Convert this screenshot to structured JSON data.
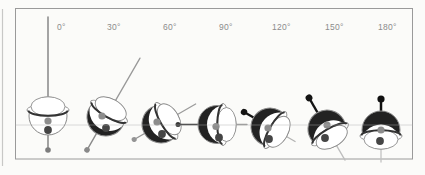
{
  "diagram": {
    "figures": [
      {
        "label": "0°",
        "angle": 0,
        "antenna_color": "#8f8f8f",
        "ball_rod_color": "#7d7d7d"
      },
      {
        "label": "30°",
        "angle": 30,
        "antenna_color": "#999999",
        "ball_rod_color": "#8a8a8a"
      },
      {
        "label": "60°",
        "angle": 60,
        "antenna_color": "#9b9b9b",
        "ball_rod_color": "#949494"
      },
      {
        "label": "90°",
        "angle": 90,
        "antenna_color": "#9b9b9b",
        "ball_rod_color": "#3a3a3a"
      },
      {
        "label": "120°",
        "angle": 120,
        "antenna_color": "#b3b3b3",
        "ball_rod_color": "#141414"
      },
      {
        "label": "150°",
        "angle": 150,
        "antenna_color": "#bdbdbd",
        "ball_rod_color": "#141414"
      },
      {
        "label": "180°",
        "angle": 180,
        "antenna_color": "#c2c2c2",
        "ball_rod_color": "#101010"
      }
    ],
    "palette": {
      "background": "#fbfbf9",
      "frame": "#9a9a9a",
      "page_edge": "#c8c8c6",
      "label_text": "#8c8c8c",
      "outline": "#8a8a8a",
      "hull_fill": "#ffffff",
      "dark_shade": "#222222",
      "seam_band": "#333333",
      "waterline": "#b0b0b0",
      "dot_light": "#8d8d8d",
      "dot_dark": "#454545"
    }
  }
}
